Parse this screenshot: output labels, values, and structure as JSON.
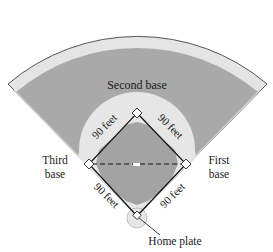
{
  "diagram": {
    "colors": {
      "outfield_grass": "#a9a9a9",
      "warning_track": "#e4e4e4",
      "infield_dirt": "#e6e6e6",
      "infield_grass": "#a3a3a3",
      "outline": "#555555",
      "background": "#ffffff"
    },
    "labels": {
      "second_base": "Second base",
      "third_base_line1": "Third",
      "third_base_line2": "base",
      "first_base_line1": "First",
      "first_base_line2": "base",
      "home_plate": "Home plate"
    },
    "distances": {
      "home_to_first": "90 feet",
      "first_to_second": "90 feet",
      "second_to_third": "90 feet",
      "third_to_home": "90 feet"
    },
    "bases": [
      {
        "name": "home-plate",
        "x": 137,
        "y": 216
      },
      {
        "name": "first-base",
        "x": 186,
        "y": 164
      },
      {
        "name": "second-base",
        "x": 137,
        "y": 113
      },
      {
        "name": "third-base",
        "x": 89,
        "y": 164
      }
    ]
  }
}
